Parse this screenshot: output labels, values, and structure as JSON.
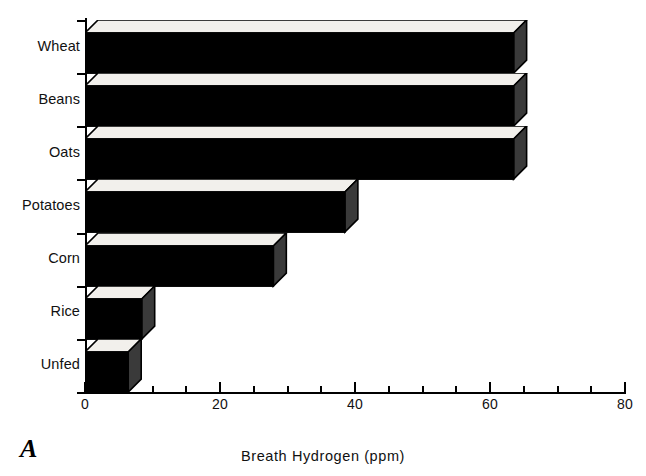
{
  "panel": {
    "label": "A"
  },
  "chart_data": {
    "type": "bar",
    "orientation": "horizontal",
    "title": "",
    "subtitle": "",
    "xlabel": "Breath Hydrogen (ppm)",
    "ylabel": "",
    "categories": [
      "Wheat",
      "Beans",
      "Oats",
      "Potatoes",
      "Corn",
      "Rice",
      "Unfed"
    ],
    "values": [
      63.5,
      63.5,
      63.5,
      38.5,
      27.9,
      8.4,
      6.4
    ],
    "xlim": [
      0,
      80
    ],
    "xticks": [
      0,
      20,
      40,
      60,
      80
    ],
    "xtick_labels": [
      "0",
      "20",
      "40",
      "60",
      "80"
    ],
    "xminor_tick_step": 5,
    "grid": false,
    "legend": false,
    "style": "3d-blocks",
    "bar_face_color": "#000000",
    "bar_top_color": "#f2f0ec",
    "bar_side_color": "#3a3a3a",
    "background_color": "#ffffff",
    "axis_color": "#000000"
  }
}
